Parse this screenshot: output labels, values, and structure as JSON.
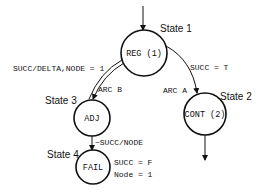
{
  "diagram": {
    "type": "state-transition",
    "colors": {
      "stroke": "#111111",
      "background": "#ffffff"
    },
    "states": [
      {
        "id": "state1",
        "name": "State 1",
        "label": "REG (1)"
      },
      {
        "id": "state2",
        "name": "State 2",
        "label": "CONT (2)"
      },
      {
        "id": "state3",
        "name": "State 3",
        "label": "ADJ"
      },
      {
        "id": "state4",
        "name": "State 4",
        "label": "FAIL"
      }
    ],
    "edges": [
      {
        "id": "entry",
        "from": "",
        "to": "state1",
        "label": ""
      },
      {
        "id": "arcA",
        "from": "state1",
        "to": "state2",
        "label": "ARC A",
        "condition": "SUCC = T"
      },
      {
        "id": "arcB",
        "from": "state3",
        "to": "state1",
        "label": "ARC B",
        "condition": "SUCC/DELTA,NODE = 1"
      },
      {
        "id": "fail",
        "from": "state3",
        "to": "state4",
        "label": "",
        "condition": "~SUCC/NODE"
      },
      {
        "id": "exit",
        "from": "state2",
        "to": "",
        "label": ""
      }
    ],
    "annotations": {
      "fail_succ": "SUCC = F",
      "fail_node": "Node = 1"
    }
  }
}
